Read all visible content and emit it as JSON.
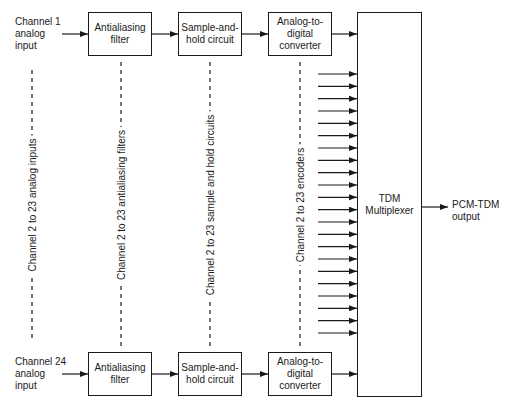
{
  "diagram": {
    "type": "block-diagram",
    "title": "",
    "top_channel": {
      "input_label": "Channel 1\nanalog\ninput",
      "filter_label": "Antialiasing\nfilter",
      "sample_hold_label": "Sample-and-\nhold circuit",
      "adc_label": "Analog-to-\ndigital\nconverter"
    },
    "bottom_channel": {
      "input_label": "Channel 24\nanalog\ninput",
      "filter_label": "Antialiasing\nfilter",
      "sample_hold_label": "Sample-and-\nhold circuit",
      "adc_label": "Analog-to-\ndigital\nconverter"
    },
    "omitted_channels": {
      "inputs_label": "Channel 2 to 23 analog inputs",
      "filters_label": "Channel 2 to 23 antialiasing filters",
      "sample_hold_label": "Channel 2 to 23 sample and hold circuits",
      "encoders_label": "Channel 2 to 23 encoders",
      "encoder_arrow_count": 22
    },
    "multiplexer": {
      "label": "TDM\nMultiplexer"
    },
    "output": {
      "label": "PCM-TDM\noutput"
    },
    "colors": {
      "line": "#1a1a1a",
      "background": "#ffffff"
    }
  }
}
